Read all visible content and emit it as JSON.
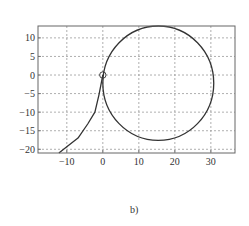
{
  "chart_data": {
    "type": "line",
    "title": "",
    "caption": "b)",
    "xlabel": "",
    "ylabel": "",
    "xlim": [
      -18,
      36.7
    ],
    "ylim": [
      -21,
      13.2
    ],
    "grid": true,
    "legend": null,
    "x_ticks": [
      -10,
      0,
      10,
      20,
      30
    ],
    "y_ticks": [
      10,
      5,
      0,
      -5,
      -10,
      -15,
      -20
    ],
    "series": [
      {
        "name": "trajectory-tail",
        "style": "solid",
        "points": [
          [
            -12.2,
            -21
          ],
          [
            -10,
            -19.3
          ],
          [
            -6.9,
            -17
          ],
          [
            -4.2,
            -13.2
          ],
          [
            -2.2,
            -10
          ],
          [
            -1.1,
            -5.4
          ],
          [
            -0.4,
            -2
          ],
          [
            0,
            0
          ]
        ]
      },
      {
        "name": "circle",
        "style": "solid",
        "shape": "circle",
        "center": [
          15.4,
          -2.2
        ],
        "radius": 15.4
      }
    ],
    "markers": [
      {
        "name": "origin-marker",
        "shape": "open-circle",
        "x": 0,
        "y": 0
      }
    ]
  },
  "colors": {
    "line": "#333333",
    "grid": "#9a9a9a",
    "frame": "#666666",
    "background": "#ffffff"
  }
}
